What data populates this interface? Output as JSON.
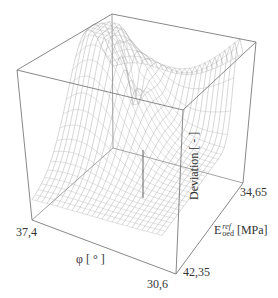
{
  "chart_data": {
    "type": "surface3d",
    "title": "",
    "xlabel": "φ [ ° ]",
    "ylabel": "E_oed^ref [MPa]",
    "ylabel_parts": {
      "base": "E",
      "sup": "ref",
      "sub": "oed",
      "unit": "[MPa]"
    },
    "zlabel": "Deviation [ - ]",
    "x_ticks": [
      "37,4",
      "30,6"
    ],
    "y_ticks": [
      "42,35",
      "34,65"
    ],
    "x_range": [
      30.6,
      37.4
    ],
    "y_range": [
      34.65,
      42.35
    ],
    "grid": false,
    "legend": null,
    "style": "wireframe mesh, grayscale",
    "surface_description": "Dome-shaped mesh high toward the back-left (large phi), descending to a sharp minimum spike near the center-front, then rising into a narrow ridge toward the back-right corner (low phi, low E_oed).",
    "features": [
      {
        "name": "dome",
        "location": "back-left",
        "relative_height": "high"
      },
      {
        "name": "minimum-spike",
        "location": "center",
        "relative_height": "lowest"
      },
      {
        "name": "ridge",
        "location": "right toward 34,65 corner",
        "relative_height": "high"
      }
    ]
  },
  "labels": {
    "x_tick_left": "37,4",
    "x_tick_right": "30,6",
    "x_title": "φ [ ° ]",
    "y_tick_front": "42,35",
    "y_tick_back": "34,65",
    "y_title_base": "E",
    "y_title_sup": "ref",
    "y_title_sub": "oed",
    "y_title_unit": " [MPa]",
    "z_title": "Deviation [ - ]"
  }
}
